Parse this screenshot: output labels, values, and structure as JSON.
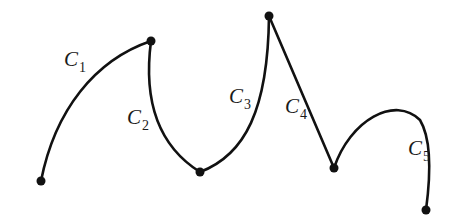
{
  "diagram": {
    "stroke_color": "#111111",
    "curves": [
      {
        "id": "C1",
        "letter": "C",
        "subscript": "1",
        "type": "curve"
      },
      {
        "id": "C2",
        "letter": "C",
        "subscript": "2",
        "type": "curve"
      },
      {
        "id": "C3",
        "letter": "C",
        "subscript": "3",
        "type": "curve"
      },
      {
        "id": "C4",
        "letter": "C",
        "subscript": "4",
        "type": "line"
      },
      {
        "id": "C5",
        "letter": "C",
        "subscript": "5",
        "type": "curve"
      }
    ],
    "endpoint_count": 6
  }
}
